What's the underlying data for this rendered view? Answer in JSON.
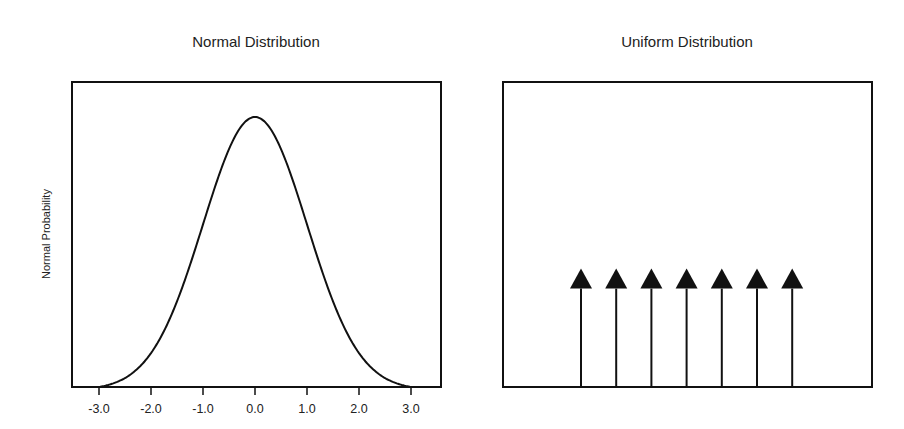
{
  "chart_data": [
    {
      "type": "line",
      "title": "Normal Distribution",
      "xlabel": "",
      "ylabel": "Normal Probability",
      "x_ticks": [
        "-3.0",
        "-2.0",
        "-1.0",
        "0.0",
        "1.0",
        "2.0",
        "3.0"
      ],
      "xlim": [
        -3.0,
        3.0
      ],
      "series": [
        {
          "name": "normal_pdf",
          "mean": 0.0,
          "sd": 1.0
        }
      ],
      "grid": false,
      "legend": "none"
    },
    {
      "type": "stem",
      "title": "Uniform Distribution",
      "xlabel": "",
      "ylabel": "",
      "x_ticks": [],
      "marker": "triangle-up",
      "categories": [
        1,
        2,
        3,
        4,
        5,
        6,
        7
      ],
      "values": [
        1,
        1,
        1,
        1,
        1,
        1,
        1
      ],
      "ylim": [
        0,
        3.1
      ],
      "grid": false,
      "legend": "none"
    }
  ]
}
